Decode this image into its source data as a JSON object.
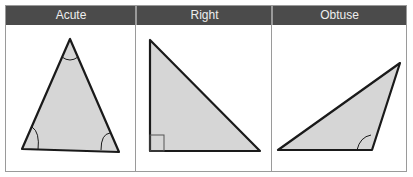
{
  "columns": [
    {
      "label": "Acute"
    },
    {
      "label": "Right"
    },
    {
      "label": "Obtuse"
    }
  ],
  "colors": {
    "header_bg": "#4b4b4b",
    "header_text": "#eeeeee",
    "triangle_fill": "#d6d6d6",
    "triangle_stroke": "#1a1a1a",
    "border": "#9a9a9a"
  }
}
